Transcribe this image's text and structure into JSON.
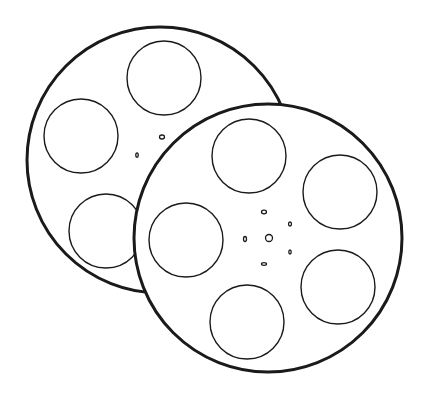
{
  "colors": {
    "background": "#ffffff",
    "stroke": "#1a1a1a",
    "fill": "#ffffff"
  },
  "reels": [
    {
      "name": "back-reel",
      "cx": 160,
      "cy": 160,
      "r": 133,
      "stroke_width": 3,
      "holes": [
        {
          "cx": 164,
          "cy": 78,
          "r": 37
        },
        {
          "cx": 81,
          "cy": 136,
          "r": 37
        },
        {
          "cx": 106,
          "cy": 231,
          "r": 37
        }
      ],
      "hub_dots": [
        {
          "cx": 162,
          "cy": 137,
          "rx": 2.5,
          "ry": 2
        },
        {
          "cx": 137,
          "cy": 155,
          "rx": 1.2,
          "ry": 2.2
        }
      ]
    },
    {
      "name": "front-reel",
      "cx": 268,
      "cy": 238,
      "r": 134,
      "stroke_width": 3,
      "holes": [
        {
          "cx": 249,
          "cy": 156,
          "r": 37
        },
        {
          "cx": 340,
          "cy": 192,
          "r": 37
        },
        {
          "cx": 186,
          "cy": 240,
          "r": 37
        },
        {
          "cx": 338,
          "cy": 287,
          "r": 37
        },
        {
          "cx": 247,
          "cy": 322,
          "r": 37
        }
      ],
      "hub_center": {
        "cx": 269,
        "cy": 238,
        "r": 3.5
      },
      "hub_dots": [
        {
          "cx": 264,
          "cy": 212,
          "rx": 2.5,
          "ry": 1.8
        },
        {
          "cx": 290,
          "cy": 224,
          "rx": 1.5,
          "ry": 2
        },
        {
          "cx": 245,
          "cy": 239,
          "rx": 1.5,
          "ry": 2.5
        },
        {
          "cx": 290,
          "cy": 252,
          "rx": 1.2,
          "ry": 2
        },
        {
          "cx": 264,
          "cy": 264,
          "rx": 2.5,
          "ry": 1.3
        }
      ]
    }
  ]
}
